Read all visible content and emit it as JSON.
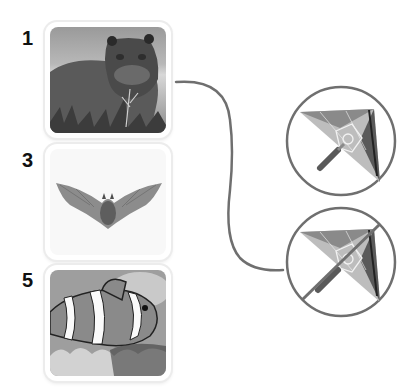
{
  "items": [
    {
      "number": "1",
      "subject": "hippopotamus"
    },
    {
      "number": "3",
      "subject": "bat"
    },
    {
      "number": "5",
      "subject": "clownfish"
    }
  ],
  "symbols": [
    {
      "subject": "kite",
      "state": "allowed"
    },
    {
      "subject": "kite",
      "state": "prohibited"
    }
  ],
  "colors": {
    "line": "#6f6f6f",
    "card_border": "#ececec",
    "number": "#111111"
  }
}
